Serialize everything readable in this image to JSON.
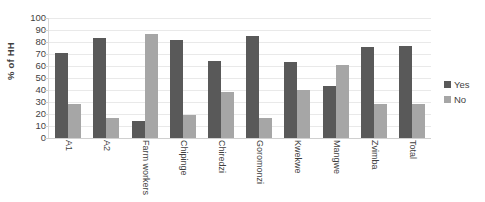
{
  "chart_data": {
    "type": "bar",
    "title": "",
    "xlabel": "",
    "ylabel": "% of HH",
    "ylim": [
      0,
      100
    ],
    "ytick_step": 10,
    "yticks": [
      100,
      90,
      80,
      70,
      60,
      50,
      40,
      30,
      20,
      10,
      0
    ],
    "grid": true,
    "legend_position": "right",
    "categories": [
      "A1",
      "A2",
      "Farm workers",
      "Chipinge",
      "Chiredzi",
      "Goromonzi",
      "Kwekwe",
      "Mangwe",
      "Zvimba",
      "Total"
    ],
    "series": [
      {
        "name": "Yes",
        "color": "#595959",
        "values": [
          71,
          83,
          14,
          82,
          64,
          85,
          63,
          43,
          76,
          77
        ]
      },
      {
        "name": "No",
        "color": "#a6a6a6",
        "values": [
          28,
          17,
          87,
          19,
          38,
          17,
          40,
          61,
          28,
          28
        ]
      }
    ]
  },
  "legend": {
    "entries": [
      {
        "label": "Yes",
        "color": "#595959"
      },
      {
        "label": "No",
        "color": "#a6a6a6"
      }
    ]
  }
}
